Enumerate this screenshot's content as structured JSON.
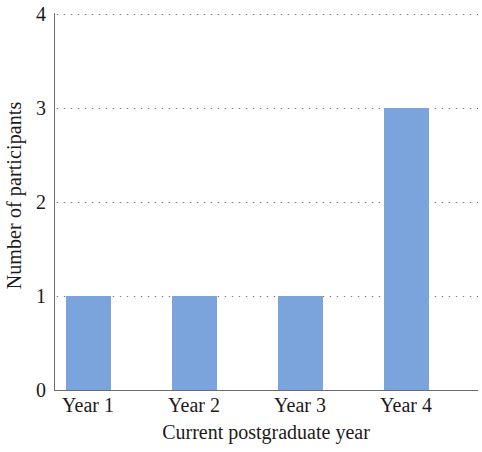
{
  "chart_data": {
    "type": "bar",
    "title": "",
    "categories": [
      "Year 1",
      "Year 2",
      "Year 3",
      "Year 4"
    ],
    "values": [
      1,
      1,
      1,
      3
    ],
    "xlabel": "Current postgraduate year",
    "ylabel": "Number of participants",
    "ylim": [
      0,
      4
    ],
    "yticks": [
      "0",
      "1",
      "2",
      "3",
      "4"
    ],
    "ytick_values": [
      0,
      1,
      2,
      3,
      4
    ],
    "grid": "horizontal-dotted",
    "legend": "none",
    "bar_color": "#7ba3dc",
    "axis_color": "#6d6d6d",
    "grid_color": "#7a7a7a",
    "background_color": "#ffffff",
    "text_color": "#1d1a1b"
  }
}
